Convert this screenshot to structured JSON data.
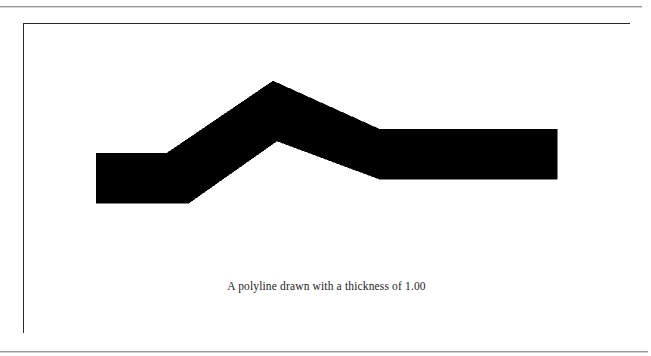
{
  "page": {
    "background_color": "#ffffff",
    "rule_color": "#9a9a9a",
    "top_rule": {
      "name": "top-horizontal-rule",
      "y": 6,
      "width": 642
    },
    "bottom_rule": {
      "name": "bottom-horizontal-rule",
      "y": 351,
      "width": 648
    }
  },
  "figure": {
    "frame": {
      "x": 23,
      "y": 23,
      "width": 607,
      "height": 310,
      "border_color": "#2b2b2b",
      "border_width": 1,
      "fill_color": "#ffffff"
    },
    "caption": "A polyline drawn with a thickness of 1.00",
    "drawing": {
      "name": "thick-polyline",
      "stroke_color": "#000000",
      "fill_color": "#000000",
      "thickness_label": "1.00",
      "join_style": "miter",
      "cap_style": "butt",
      "vertices": [
        {
          "x": 72,
          "y": 153
        },
        {
          "x": 152,
          "y": 153
        },
        {
          "x": 249,
          "y": 58
        },
        {
          "x": 355,
          "y": 130
        },
        {
          "x": 533,
          "y": 130
        }
      ],
      "outline_points": [
        {
          "x": 72,
          "y": 129
        },
        {
          "x": 143,
          "y": 129
        },
        {
          "x": 249,
          "y": 57
        },
        {
          "x": 355,
          "y": 105
        },
        {
          "x": 533,
          "y": 105
        },
        {
          "x": 533,
          "y": 155
        },
        {
          "x": 355,
          "y": 155
        },
        {
          "x": 253,
          "y": 117
        },
        {
          "x": 165,
          "y": 179
        },
        {
          "x": 72,
          "y": 179
        }
      ]
    }
  },
  "chart_data": {
    "type": "line",
    "title": "A polyline drawn with a thickness of 1.00",
    "xlabel": "",
    "ylabel": "",
    "grid": false,
    "legend": "none",
    "series": [
      {
        "name": "polyline",
        "points": [
          {
            "x": 72,
            "y": 153
          },
          {
            "x": 152,
            "y": 153
          },
          {
            "x": 249,
            "y": 58
          },
          {
            "x": 355,
            "y": 130
          },
          {
            "x": 533,
            "y": 130
          }
        ],
        "stroke_color": "#000000",
        "stroke_width": 50
      }
    ],
    "xlim": [
      0,
      607
    ],
    "ylim": [
      310,
      0
    ]
  }
}
